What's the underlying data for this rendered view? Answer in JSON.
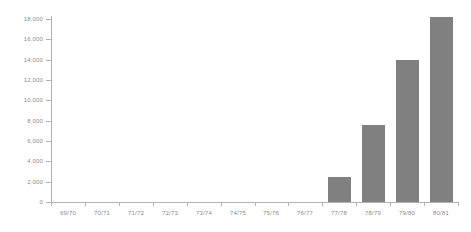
{
  "chart_data": {
    "type": "bar",
    "title": "",
    "subtitle": "",
    "xlabel": "",
    "ylabel": "",
    "categories": [
      "69/70",
      "70/71",
      "71/72",
      "72/73",
      "73/74",
      "74/75",
      "75/76",
      "76/77",
      "77/78",
      "78/79",
      "79/80",
      "80/81"
    ],
    "values": [
      0,
      0,
      0,
      0,
      0,
      0,
      0,
      0,
      2500,
      7600,
      14000,
      18200
    ],
    "series": [
      {
        "name": "",
        "values": [
          0,
          0,
          0,
          0,
          0,
          0,
          0,
          0,
          2500,
          7600,
          14000,
          18200
        ]
      }
    ],
    "ylim": [
      0,
      18000
    ],
    "ytick_values": [
      0,
      2000,
      4000,
      6000,
      8000,
      10000,
      12000,
      14000,
      16000,
      18000
    ],
    "ytick_labels": [
      "0",
      "2,000",
      "4,000",
      "6,000",
      "8,000",
      "10,000",
      "12,000",
      "14,000",
      "16,000",
      "18,000"
    ],
    "grid": false,
    "legend": false,
    "legend_position": "none",
    "bar_color": "#808080",
    "axis_color": "#b3b3b3",
    "label_color": "#8c8c8c",
    "background_color": "#ffffff"
  }
}
